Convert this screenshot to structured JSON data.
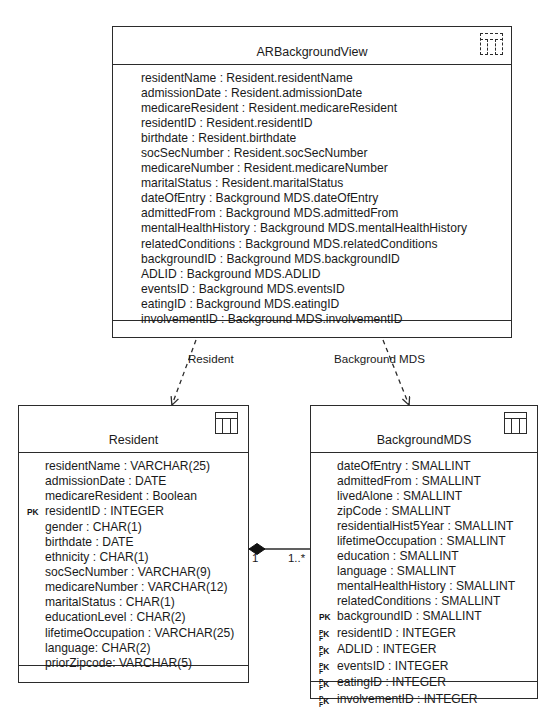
{
  "diagram": {
    "stroke_color": "#2b2b2b",
    "background_color": "#ffffff"
  },
  "view_class": {
    "name": "ARBackgroundView",
    "stereotype_icon": "view-table-icon",
    "attributes": [
      {
        "key": "",
        "text": "residentName : Resident.residentName"
      },
      {
        "key": "",
        "text": "admissionDate : Resident.admissionDate"
      },
      {
        "key": "",
        "text": "medicareResident : Resident.medicareResident"
      },
      {
        "key": "",
        "text": "residentID : Resident.residentID"
      },
      {
        "key": "",
        "text": "birthdate : Resident.birthdate"
      },
      {
        "key": "",
        "text": "socSecNumber : Resident.socSecNumber"
      },
      {
        "key": "",
        "text": "medicareNumber : Resident.medicareNumber"
      },
      {
        "key": "",
        "text": "maritalStatus : Resident.maritalStatus"
      },
      {
        "key": "",
        "text": "dateOfEntry : Background MDS.dateOfEntry"
      },
      {
        "key": "",
        "text": "admittedFrom : Background MDS.admittedFrom"
      },
      {
        "key": "",
        "text": "mentalHealthHistory : Background MDS.mentalHealthHistory"
      },
      {
        "key": "",
        "text": "relatedConditions : Background MDS.relatedConditions"
      },
      {
        "key": "",
        "text": "backgroundID : Background MDS.backgroundID"
      },
      {
        "key": "",
        "text": "ADLID : Background MDS.ADLID"
      },
      {
        "key": "",
        "text": "eventsID : Background MDS.eventsID"
      },
      {
        "key": "",
        "text": "eatingID : Background MDS.eatingID"
      },
      {
        "key": "",
        "text": "involvementID : Background MDS.involvementID"
      }
    ]
  },
  "resident_class": {
    "name": "Resident",
    "stereotype_icon": "table-icon",
    "attributes": [
      {
        "key": "",
        "text": "residentName : VARCHAR(25)"
      },
      {
        "key": "",
        "text": "admissionDate : DATE"
      },
      {
        "key": "",
        "text": "medicareResident : Boolean"
      },
      {
        "key": "PK",
        "text": "residentID : INTEGER"
      },
      {
        "key": "",
        "text": "gender : CHAR(1)"
      },
      {
        "key": "",
        "text": "birthdate : DATE"
      },
      {
        "key": "",
        "text": "ethnicity : CHAR(1)"
      },
      {
        "key": "",
        "text": "socSecNumber : VARCHAR(9)"
      },
      {
        "key": "",
        "text": "medicareNumber : VARCHAR(12)"
      },
      {
        "key": "",
        "text": "maritalStatus : CHAR(1)"
      },
      {
        "key": "",
        "text": "educationLevel : CHAR(2)"
      },
      {
        "key": "",
        "text": "lifetimeOccupation : VARCHAR(25)"
      },
      {
        "key": "",
        "text": "language: CHAR(2)"
      },
      {
        "key": "",
        "text": "priorZipcode: VARCHAR(5)"
      }
    ]
  },
  "background_class": {
    "name": "BackgroundMDS",
    "stereotype_icon": "table-icon",
    "attributes": [
      {
        "key": "",
        "text": "dateOfEntry : SMALLINT"
      },
      {
        "key": "",
        "text": "admittedFrom : SMALLINT"
      },
      {
        "key": "",
        "text": "livedAlone : SMALLINT"
      },
      {
        "key": "",
        "text": "zipCode : SMALLINT"
      },
      {
        "key": "",
        "text": "residentialHist5Year : SMALLINT"
      },
      {
        "key": "",
        "text": "lifetimeOccupation : SMALLINT"
      },
      {
        "key": "",
        "text": "education : SMALLINT"
      },
      {
        "key": "",
        "text": "language : SMALLINT"
      },
      {
        "key": "",
        "text": "mentalHealthHistory : SMALLINT"
      },
      {
        "key": "",
        "text": "relatedConditions : SMALLINT"
      },
      {
        "key": "PK",
        "text": "backgroundID : SMALLINT"
      },
      {
        "key": "PKFK",
        "text": "residentID : INTEGER"
      },
      {
        "key": "PKFK",
        "text": "ADLID : INTEGER"
      },
      {
        "key": "PKFK",
        "text": "eventsID : INTEGER"
      },
      {
        "key": "PKFK",
        "text": "eatingID : INTEGER"
      },
      {
        "key": "PKFK",
        "text": "involvementID : INTEGER"
      }
    ]
  },
  "connectors": {
    "dependency_resident_label": "Resident",
    "dependency_background_label": "Background MDS",
    "multiplicity_left": "1",
    "multiplicity_right": "1..*"
  }
}
